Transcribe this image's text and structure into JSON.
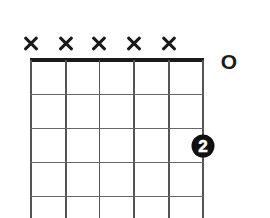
{
  "chord_diagram": {
    "strings": 6,
    "frets_visible": 4,
    "string_markers": [
      {
        "string": 1,
        "marker": "x",
        "meaning": "muted"
      },
      {
        "string": 2,
        "marker": "x",
        "meaning": "muted"
      },
      {
        "string": 3,
        "marker": "x",
        "meaning": "muted"
      },
      {
        "string": 4,
        "marker": "x",
        "meaning": "muted"
      },
      {
        "string": 5,
        "marker": "x",
        "meaning": "muted"
      },
      {
        "string": 6,
        "marker": "O",
        "meaning": "open"
      }
    ],
    "open_label": "O",
    "fingers": [
      {
        "string": 6,
        "fret": 3,
        "finger": "2"
      }
    ],
    "colors": {
      "ink": "#1a1a1a",
      "grid": "#555555",
      "background": "#ffffff",
      "finger_dot": "#111111",
      "finger_text": "#ffffff"
    }
  }
}
